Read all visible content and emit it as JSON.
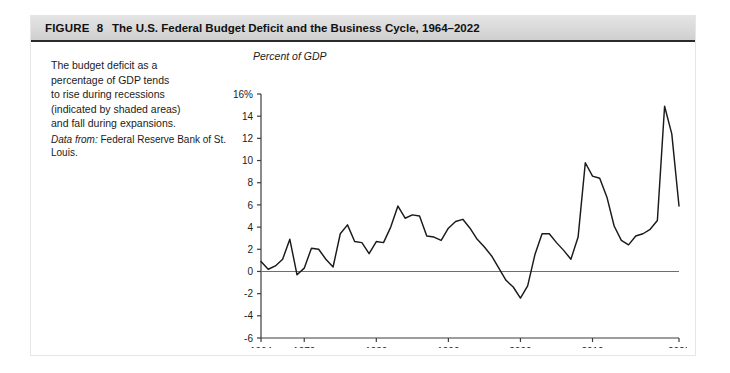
{
  "figure": {
    "label": "FIGURE",
    "number": "8",
    "title": "The U.S. Federal Budget Deficit and the Business Cycle, 1964–2022"
  },
  "caption": {
    "lines": [
      "The budget deficit as a",
      "percentage of GDP tends",
      "to rise during recessions",
      "(indicated by shaded areas)",
      "and fall during expansions."
    ],
    "source_label": "Data from:",
    "source_text": "Federal Reserve Bank of St. Louis."
  },
  "colors": {
    "line": "#1a1a1a",
    "axis": "#3c3c3c",
    "zero_line": "#6f6f6f",
    "header_band": "#d9d9d9",
    "text": "#1b1b1b"
  },
  "chart_data": {
    "type": "line",
    "title": "The U.S. Federal Budget Deficit and the Business Cycle, 1964–2022",
    "xlabel": "",
    "ylabel": "Percent of GDP",
    "ylim": [
      -6,
      16
    ],
    "xlim": [
      1964,
      2022
    ],
    "ytick_labels": [
      "16%",
      "14",
      "12",
      "10",
      "8",
      "6",
      "4",
      "2",
      "0",
      "-2",
      "-4",
      "-6"
    ],
    "yticks": [
      16,
      14,
      12,
      10,
      8,
      6,
      4,
      2,
      0,
      -2,
      -4,
      -6
    ],
    "xticks": [
      1964,
      1970,
      1980,
      1990,
      2000,
      2010,
      2022
    ],
    "xtick_labels": [
      "1964",
      "1970",
      "1980",
      "1990",
      "2000",
      "2010",
      "2022"
    ],
    "grid": false,
    "legend": null,
    "zero_reference_line": 0,
    "series": [
      {
        "name": "Federal budget deficit (percent of GDP)",
        "x": [
          1964,
          1965,
          1966,
          1967,
          1968,
          1969,
          1970,
          1971,
          1972,
          1973,
          1974,
          1975,
          1976,
          1977,
          1978,
          1979,
          1980,
          1981,
          1982,
          1983,
          1984,
          1985,
          1986,
          1987,
          1988,
          1989,
          1990,
          1991,
          1992,
          1993,
          1994,
          1995,
          1996,
          1997,
          1998,
          1999,
          2000,
          2001,
          2002,
          2003,
          2004,
          2005,
          2006,
          2007,
          2008,
          2009,
          2010,
          2011,
          2012,
          2013,
          2014,
          2015,
          2016,
          2017,
          2018,
          2019,
          2020,
          2021,
          2022
        ],
        "values": [
          0.9,
          0.2,
          0.5,
          1.1,
          2.9,
          -0.3,
          0.3,
          2.1,
          2.0,
          1.1,
          0.4,
          3.4,
          4.2,
          2.7,
          2.6,
          1.6,
          2.7,
          2.6,
          4.0,
          5.9,
          4.8,
          5.1,
          5.0,
          3.2,
          3.1,
          2.8,
          3.9,
          4.5,
          4.7,
          3.9,
          2.9,
          2.2,
          1.4,
          0.3,
          -0.8,
          -1.4,
          -2.4,
          -1.3,
          1.5,
          3.4,
          3.4,
          2.6,
          1.9,
          1.1,
          3.1,
          9.8,
          8.6,
          8.4,
          6.7,
          4.1,
          2.8,
          2.4,
          3.2,
          3.4,
          3.8,
          4.6,
          14.9,
          12.4,
          5.9
        ],
        "peaks": [
          {
            "year": 1983,
            "value": 5.9,
            "note": "1980s deficit peak"
          },
          {
            "year": 2009,
            "value": 9.8,
            "note": "Great Recession peak"
          },
          {
            "year": 2020,
            "value": 14.9,
            "note": "COVID-19 peak"
          }
        ],
        "troughs": [
          {
            "year": 2000,
            "value": -2.4,
            "note": "budget surplus"
          },
          {
            "year": 1969,
            "value": -0.3,
            "note": "budget surplus"
          }
        ]
      }
    ]
  }
}
